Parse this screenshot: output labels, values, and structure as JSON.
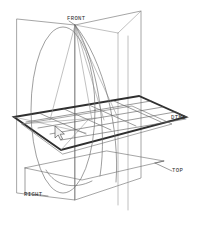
{
  "viewport": {
    "width": 202,
    "height": 232,
    "background_color": "#ffffff",
    "view_type": "3D wireframe isometric"
  },
  "labels": {
    "front": "FRONT",
    "top": "TOP",
    "right": "RIGHT",
    "dtm1": "DTM1"
  },
  "colors": {
    "line": "#6e6e6e",
    "datum_border": "#2f2f2f",
    "grid": "#5f2f2f",
    "text": "#2b2b2b",
    "curve": "#6b6b6b",
    "cursor_fill": "#f2f2f2",
    "cursor_stroke": "#2e2e2e"
  },
  "icons": {
    "cursor": "mouse-pointer-icon"
  },
  "geometry": {
    "grid_columns": 5,
    "grid_rows": 4,
    "datum_plane_count": 4,
    "curve_count": 2
  }
}
